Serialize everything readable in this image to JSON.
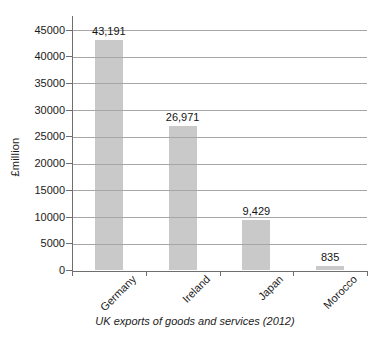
{
  "chart_data": {
    "type": "bar",
    "categories": [
      "Germany",
      "Ireland",
      "Japan",
      "Morocco"
    ],
    "values": [
      43191,
      26971,
      9429,
      835
    ],
    "value_labels": [
      "43,191",
      "26,971",
      "9,429",
      "835"
    ],
    "title": "UK exports of goods and services (2012)",
    "xlabel": "",
    "ylabel": "£million",
    "ylim": [
      0,
      45000
    ],
    "ytick_step": 5000,
    "ytick_labels": [
      "0",
      "5000",
      "10000",
      "15000",
      "20000",
      "25000",
      "30000",
      "35000",
      "40000",
      "45000"
    ],
    "grid": true,
    "legend": false,
    "bar_color": "#c9c9c9",
    "gridline_color": "#a6a6a6",
    "axis_color": "#6e6e6e",
    "text_color": "#1b1b1b"
  }
}
